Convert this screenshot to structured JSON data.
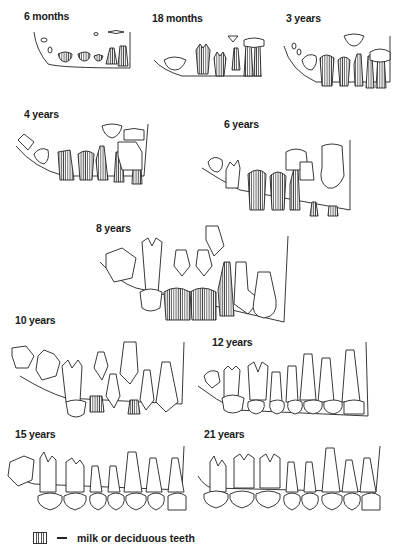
{
  "figure": {
    "header_faint_text": "",
    "panels": [
      {
        "id": "p6m",
        "label": "6 months"
      },
      {
        "id": "p18m",
        "label": "18 months"
      },
      {
        "id": "p3y",
        "label": "3 years"
      },
      {
        "id": "p4y",
        "label": "4 years"
      },
      {
        "id": "p6y",
        "label": "6 years"
      },
      {
        "id": "p8y",
        "label": "8 years"
      },
      {
        "id": "p10y",
        "label": "10 years"
      },
      {
        "id": "p12y",
        "label": "12 years"
      },
      {
        "id": "p15y",
        "label": "15 years"
      },
      {
        "id": "p21y",
        "label": "21 years"
      }
    ],
    "legend": {
      "symbol": "vertical-hatch-swatch",
      "dash": "—",
      "text": "milk or deciduous teeth"
    }
  }
}
